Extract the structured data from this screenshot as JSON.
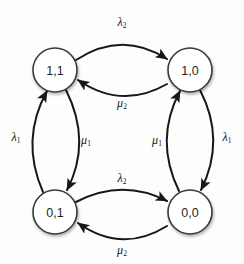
{
  "diagram": {
    "type": "state-transition-diagram",
    "colors": {
      "background": "#fdfdfd",
      "node_fill": "#ffffff",
      "node_stroke": "#3a3a3a",
      "edge_stroke": "#171717",
      "text": "#1f1f1f"
    },
    "nodes": [
      {
        "id": "s11",
        "label": "1,1",
        "cx": 55,
        "cy": 70,
        "r": 22
      },
      {
        "id": "s10",
        "label": "1,0",
        "cx": 190,
        "cy": 70,
        "r": 22
      },
      {
        "id": "s01",
        "label": "0,1",
        "cx": 55,
        "cy": 212,
        "r": 22
      },
      {
        "id": "s00",
        "label": "0,0",
        "cx": 190,
        "cy": 212,
        "r": 22
      }
    ],
    "edges": [
      {
        "id": "e-top-right",
        "from": "1,1",
        "to": "1,0",
        "rate": "λ",
        "subscript": "2",
        "label": "λ₂",
        "direction": "rightward",
        "position": "top-outer"
      },
      {
        "id": "e-top-left",
        "from": "1,0",
        "to": "1,1",
        "rate": "μ",
        "subscript": "2",
        "label": "μ₂",
        "direction": "leftward",
        "position": "top-inner"
      },
      {
        "id": "e-bottom-right",
        "from": "0,1",
        "to": "0,0",
        "rate": "λ",
        "subscript": "2",
        "label": "λ₂",
        "direction": "rightward",
        "position": "bottom-inner"
      },
      {
        "id": "e-bottom-left",
        "from": "0,0",
        "to": "0,1",
        "rate": "μ",
        "subscript": "2",
        "label": "μ₂",
        "direction": "leftward",
        "position": "bottom-outer"
      },
      {
        "id": "e-left-up",
        "from": "0,1",
        "to": "1,1",
        "rate": "λ",
        "subscript": "1",
        "label": "λ₁",
        "direction": "upward",
        "position": "left-outer"
      },
      {
        "id": "e-left-down",
        "from": "1,1",
        "to": "0,1",
        "rate": "μ",
        "subscript": "1",
        "label": "μ₁",
        "direction": "downward",
        "position": "left-inner"
      },
      {
        "id": "e-right-up",
        "from": "0,0",
        "to": "1,0",
        "rate": "μ",
        "subscript": "1",
        "label": "μ₁",
        "direction": "upward",
        "position": "right-inner"
      },
      {
        "id": "e-right-down",
        "from": "1,0",
        "to": "0,0",
        "rate": "λ",
        "subscript": "1",
        "label": "λ₁",
        "direction": "downward",
        "position": "right-outer"
      }
    ],
    "labels": {
      "top": {
        "rate": "λ",
        "sub": "2",
        "x": 122,
        "y": 22
      },
      "top_inner": {
        "rate": "μ",
        "sub": "2",
        "x": 122,
        "y": 103
      },
      "left_outer": {
        "rate": "λ",
        "sub": "1",
        "x": 16,
        "y": 137
      },
      "left_inner": {
        "rate": "μ",
        "sub": "1",
        "x": 86,
        "y": 140
      },
      "right_inner": {
        "rate": "μ",
        "sub": "1",
        "x": 157,
        "y": 140
      },
      "right_outer": {
        "rate": "λ",
        "sub": "1",
        "x": 227,
        "y": 137
      },
      "bottom_inner": {
        "rate": "λ",
        "sub": "2",
        "x": 122,
        "y": 178
      },
      "bottom_outer": {
        "rate": "μ",
        "sub": "2",
        "x": 122,
        "y": 250
      }
    }
  }
}
